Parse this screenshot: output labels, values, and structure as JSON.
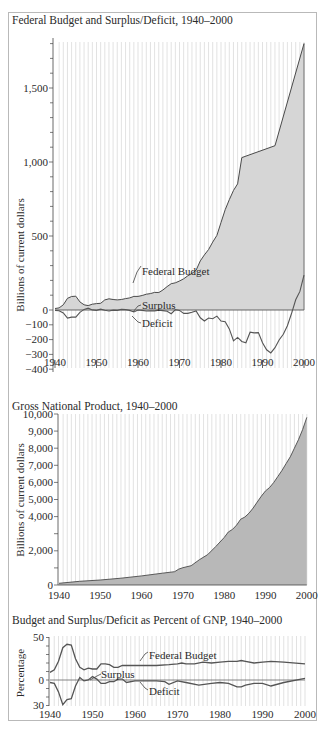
{
  "chart_data": [
    {
      "type": "area",
      "title": "Federal Budget and Surplus/Deficit, 1940–2000",
      "xlabel": "",
      "ylabel": "Billions of current dollars",
      "xlim": [
        1940,
        2000
      ],
      "ylim": [
        -400,
        1900
      ],
      "x_ticks": [
        "1940",
        "1950",
        "1960",
        "1970",
        "1980",
        "1990",
        "2000"
      ],
      "y_ticks": [
        "1,500",
        "1,000",
        "500",
        "0",
        "−100",
        "−200",
        "−300",
        "−400"
      ],
      "grid": "vertical yearly lines",
      "annotations": [
        "Federal Budget",
        "Surplus",
        "Deficit"
      ],
      "series": [
        {
          "name": "Federal Budget",
          "x": [
            1940,
            1941,
            1942,
            1943,
            1944,
            1945,
            1946,
            1947,
            1948,
            1949,
            1950,
            1951,
            1952,
            1953,
            1954,
            1955,
            1956,
            1957,
            1958,
            1959,
            1960,
            1961,
            1962,
            1963,
            1964,
            1965,
            1966,
            1967,
            1968,
            1969,
            1970,
            1971,
            1972,
            1973,
            1974,
            1975,
            1976,
            1977,
            1978,
            1979,
            1980,
            1981,
            1982,
            1983,
            1984,
            1985,
            1993,
            2000
          ],
          "values": [
            10,
            14,
            35,
            79,
            91,
            93,
            55,
            35,
            30,
            39,
            43,
            45,
            68,
            76,
            71,
            68,
            71,
            77,
            82,
            92,
            92,
            98,
            107,
            111,
            119,
            118,
            135,
            158,
            178,
            184,
            196,
            211,
            231,
            247,
            269,
            332,
            372,
            409,
            459,
            504,
            591,
            678,
            745,
            808,
            852,
            1030,
            1110,
            1800
          ]
        },
        {
          "name": "Surplus/Deficit",
          "x": [
            1940,
            1941,
            1942,
            1943,
            1944,
            1945,
            1946,
            1947,
            1948,
            1949,
            1950,
            1951,
            1952,
            1953,
            1954,
            1955,
            1956,
            1957,
            1958,
            1959,
            1960,
            1961,
            1962,
            1963,
            1964,
            1965,
            1966,
            1967,
            1968,
            1969,
            1970,
            1971,
            1972,
            1973,
            1974,
            1975,
            1976,
            1977,
            1978,
            1979,
            1980,
            1981,
            1982,
            1983,
            1984,
            1985,
            1986,
            1987,
            1988,
            1989,
            1990,
            1991,
            1992,
            1993,
            1994,
            1995,
            1996,
            1997,
            1998,
            1999,
            2000
          ],
          "values": [
            -3,
            -5,
            -20,
            -55,
            -48,
            -48,
            -16,
            4,
            12,
            1,
            -3,
            6,
            -2,
            -7,
            -1,
            -3,
            4,
            3,
            -3,
            -13,
            0,
            -3,
            -7,
            -5,
            -6,
            -1,
            -4,
            -9,
            -25,
            3,
            -3,
            -23,
            -23,
            -15,
            -6,
            -53,
            -74,
            -54,
            -59,
            -41,
            -74,
            -79,
            -128,
            -208,
            -185,
            -212,
            -221,
            -150,
            -155,
            -153,
            -221,
            -269,
            -290,
            -255,
            -203,
            -164,
            -107,
            -22,
            69,
            126,
            236
          ]
        }
      ]
    },
    {
      "type": "area",
      "title": "Gross National Product, 1940–2000",
      "xlabel": "",
      "ylabel": "Billions of current dollars",
      "xlim": [
        1940,
        2000
      ],
      "ylim": [
        0,
        10000
      ],
      "x_ticks": [
        "1940",
        "1950",
        "1960",
        "1970",
        "1980",
        "1990",
        "2000"
      ],
      "y_ticks": [
        "10,000",
        "9,000",
        "8,000",
        "7,000",
        "6,000",
        "5,000",
        "4,000",
        "2,000",
        "0"
      ],
      "grid": "vertical yearly lines",
      "series": [
        {
          "name": "GNP",
          "x": [
            1940,
            1945,
            1950,
            1955,
            1960,
            1965,
            1968,
            1969,
            1970,
            1972,
            1974,
            1976,
            1978,
            1980,
            1981,
            1982,
            1983,
            1984,
            1985,
            1986,
            1987,
            1988,
            1989,
            1990,
            1991,
            1992,
            1993,
            1994,
            1995,
            1996,
            1997,
            1998,
            1999,
            2000
          ],
          "values": [
            100,
            215,
            290,
            400,
            530,
            690,
            780,
            930,
            1010,
            1130,
            1480,
            1780,
            2260,
            2780,
            3100,
            3250,
            3500,
            3850,
            3970,
            4200,
            4500,
            4850,
            5200,
            5500,
            5700,
            6000,
            6350,
            6700,
            7100,
            7500,
            8000,
            8500,
            9100,
            9800
          ]
        }
      ]
    },
    {
      "type": "line",
      "title": "Budget and Surplus/Deficit as Percent of GNP, 1940–2000",
      "xlabel": "",
      "ylabel": "Percentage",
      "xlim": [
        1940,
        2000
      ],
      "ylim": [
        -30,
        50
      ],
      "x_ticks": [
        "1940",
        "1950",
        "1960",
        "1970",
        "1980",
        "1990",
        "2000"
      ],
      "y_ticks": [
        "50",
        "0",
        "30"
      ],
      "grid": "vertical yearly lines",
      "annotations": [
        "Federal Budget",
        "Surplus",
        "Deficit"
      ],
      "series": [
        {
          "name": "Federal Budget",
          "x": [
            1940,
            1941,
            1942,
            1943,
            1944,
            1945,
            1946,
            1947,
            1948,
            1949,
            1950,
            1951,
            1952,
            1953,
            1954,
            1955,
            1956,
            1957,
            1958,
            1960,
            1965,
            1968,
            1970,
            1971,
            1972,
            1974,
            1976,
            1978,
            1980,
            1982,
            1984,
            1985,
            1986,
            1988,
            1990,
            1992,
            1995,
            2000
          ],
          "values": [
            9,
            12,
            22,
            38,
            42,
            41,
            25,
            15,
            12,
            14,
            13,
            13,
            19,
            19,
            18,
            15,
            15,
            17,
            17,
            17,
            17,
            18,
            19,
            20,
            19,
            19,
            21,
            20,
            21,
            22,
            22,
            23,
            22,
            20,
            21,
            22,
            21,
            19
          ]
        },
        {
          "name": "Surplus/Deficit",
          "x": [
            1940,
            1941,
            1942,
            1943,
            1944,
            1945,
            1946,
            1947,
            1948,
            1949,
            1950,
            1951,
            1952,
            1953,
            1954,
            1955,
            1956,
            1957,
            1958,
            1960,
            1962,
            1965,
            1967,
            1968,
            1970,
            1972,
            1975,
            1978,
            1980,
            1982,
            1983,
            1984,
            1985,
            1986,
            1988,
            1990,
            1992,
            1995,
            2000
          ],
          "values": [
            -3,
            -4,
            -14,
            -29,
            -23,
            -22,
            -7,
            3,
            -1,
            0,
            4,
            1,
            -4,
            -4,
            -2,
            -2,
            1,
            1,
            -3,
            -1,
            -1,
            -1,
            -2,
            -5,
            -1,
            -3,
            -6,
            -4,
            -3,
            -4,
            -6,
            -8,
            -8,
            -6,
            -4,
            -4,
            -7,
            -3,
            2
          ]
        }
      ]
    }
  ],
  "panels": {
    "budget": {
      "title": "Federal Budget and Surplus/Deficit, 1940–2000",
      "ylabel": "Billions of current dollars",
      "label_budget": "Federal Budget",
      "label_surplus": "Surplus",
      "label_deficit": "Deficit"
    },
    "gnp": {
      "title": "Gross National Product, 1940–2000",
      "ylabel": "Billions of current dollars"
    },
    "percent": {
      "title": "Budget and Surplus/Deficit as Percent of GNP, 1940–2000",
      "ylabel": "Percentage",
      "label_budget": "Federal Budget",
      "label_surplus": "Surplus",
      "label_deficit": "Deficit"
    }
  },
  "colors": {
    "area_light": "#d2d2d2",
    "area_dark": "#b3b3b3",
    "line": "#4a4a4a",
    "grid": "#c8c8c8",
    "frame": "#b9b9b9"
  }
}
